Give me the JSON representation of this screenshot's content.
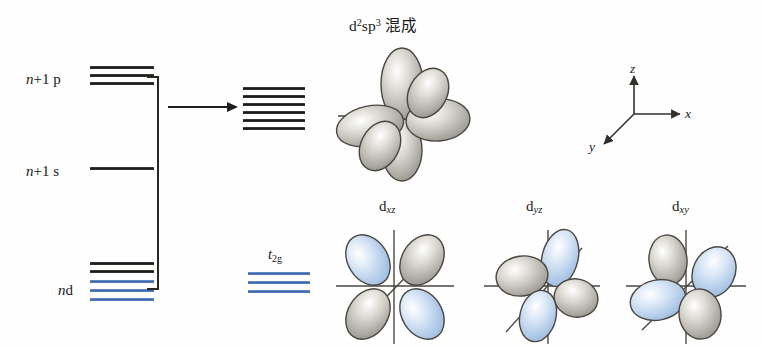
{
  "figure": {
    "type": "orbital-energy-diagram",
    "background_color": "#fefefe",
    "colors": {
      "black_level": "#1c1a18",
      "blue_level": "#3b66ab",
      "gray_lobe": "#b9b7b0",
      "blue_lobe": "#bdd2ec",
      "outline": "#3a3733",
      "axis": "#33302c"
    }
  },
  "left_panel": {
    "levels": [
      {
        "label_prefix": "n",
        "label_plus": "+1 p",
        "label_full": "n+1 p",
        "line_count": 3,
        "line_color": "black",
        "y": 72
      },
      {
        "label_prefix": "n",
        "label_plus": "+1 s",
        "label_full": "n+1 s",
        "line_count": 1,
        "line_color": "black",
        "y": 167
      },
      {
        "label_prefix": "n",
        "label_plus": "d",
        "label_full": "nd",
        "line_count_black": 2,
        "line_count_blue": 3,
        "y": 270
      }
    ],
    "bracket": {
      "top": 76,
      "bottom": 288,
      "x": 153
    }
  },
  "transition": {
    "arrow": {
      "label": "",
      "direction": "right",
      "x": 163,
      "y": 107
    }
  },
  "right_panel": {
    "hybrid_level": {
      "line_count": 6,
      "line_color": "black",
      "title": "d²sp³ 混成",
      "title_base": "d",
      "title_sup1": "2",
      "title_mid": "sp",
      "title_sup2": "3",
      "title_tail": "混成"
    },
    "t2g_level": {
      "label_italic": "t",
      "label_sub": "2g",
      "label_full": "t2g",
      "line_count": 3,
      "line_color": "blue"
    }
  },
  "orbitals": [
    {
      "name": "d2sp3-hybrid",
      "label": "d²sp³ 混成",
      "lobe_count": 6,
      "lobe_colors": [
        "gray",
        "gray",
        "gray",
        "gray",
        "gray",
        "gray"
      ]
    },
    {
      "name": "dxz",
      "label_base": "d",
      "label_sub": "xz",
      "label_full": "dxz",
      "lobe_count": 4,
      "lobe_colors": [
        "blue",
        "gray",
        "gray",
        "blue"
      ]
    },
    {
      "name": "dyz",
      "label_base": "d",
      "label_sub": "yz",
      "label_full": "dyz",
      "lobe_count": 4,
      "lobe_colors": [
        "blue",
        "gray",
        "gray",
        "blue"
      ]
    },
    {
      "name": "dxy",
      "label_base": "d",
      "label_sub": "xy",
      "label_full": "dxy",
      "lobe_count": 4,
      "lobe_colors": [
        "gray",
        "blue",
        "blue",
        "gray"
      ]
    }
  ],
  "axes_legend": {
    "z": "z",
    "x": "x",
    "y": "y"
  }
}
